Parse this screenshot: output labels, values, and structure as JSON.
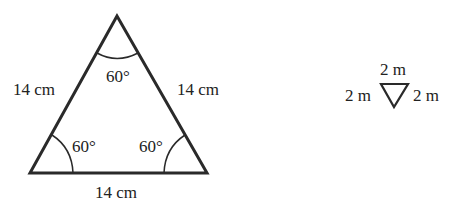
{
  "diagram": {
    "large_triangle": {
      "sides": {
        "left": "14 cm",
        "right": "14 cm",
        "bottom": "14 cm"
      },
      "angles": {
        "top": "60°",
        "bottom_left": "60°",
        "bottom_right": "60°"
      }
    },
    "small_triangle": {
      "sides": {
        "top": "2 m",
        "left": "2 m",
        "right": "2 m"
      }
    },
    "stroke_color": "#2a2a2a"
  }
}
